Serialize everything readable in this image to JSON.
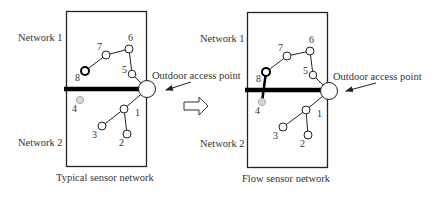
{
  "diagram": {
    "transition_arrow": "hollow-right-arrow",
    "panels": [
      {
        "caption": "Typical sensor network",
        "top_label": "Network 1",
        "bottom_label": "Network 2",
        "access_point_label": "Outdoor access point",
        "nodes": [
          {
            "id": "1",
            "label": "1"
          },
          {
            "id": "2",
            "label": "2"
          },
          {
            "id": "3",
            "label": "3"
          },
          {
            "id": "4",
            "label": "4",
            "state": "isolated-gray"
          },
          {
            "id": "5",
            "label": "5"
          },
          {
            "id": "6",
            "label": "6"
          },
          {
            "id": "7",
            "label": "7"
          },
          {
            "id": "8",
            "label": "8",
            "state": "bold-outline"
          }
        ]
      },
      {
        "caption": "Flow sensor network",
        "top_label": "Network 1",
        "bottom_label": "Network 2",
        "access_point_label": "Outdoor access point",
        "nodes": [
          {
            "id": "1",
            "label": "1"
          },
          {
            "id": "2",
            "label": "2"
          },
          {
            "id": "3",
            "label": "3"
          },
          {
            "id": "4",
            "label": "4",
            "state": "gray-connected-via-8"
          },
          {
            "id": "5",
            "label": "5"
          },
          {
            "id": "6",
            "label": "6"
          },
          {
            "id": "7",
            "label": "7"
          },
          {
            "id": "8",
            "label": "8",
            "state": "bold-outline"
          }
        ]
      }
    ]
  }
}
